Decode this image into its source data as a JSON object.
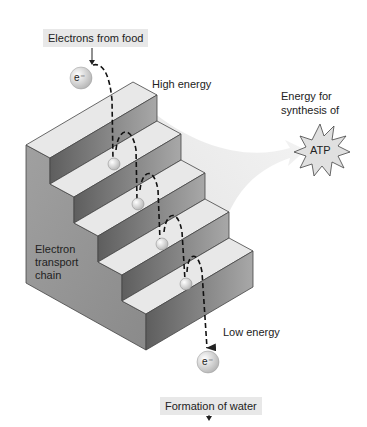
{
  "diagram": {
    "labels": {
      "source": "Electrons from food",
      "high_energy": "High energy",
      "energy_for_line1": "Energy for",
      "energy_for_line2": "synthesis of",
      "atp": "ATP",
      "chain_line1": "Electron",
      "chain_line2": "transport",
      "chain_line3": "chain",
      "low_energy": "Low energy",
      "sink": "Formation of water",
      "electron": "e⁻"
    },
    "steps": 5,
    "colors": {
      "tread": "#e6e6e6",
      "riser": "#7a7a7a",
      "side": "#9c9c9c",
      "arrow_fill": "#ececec",
      "label_box": "#e8e8e8"
    }
  }
}
